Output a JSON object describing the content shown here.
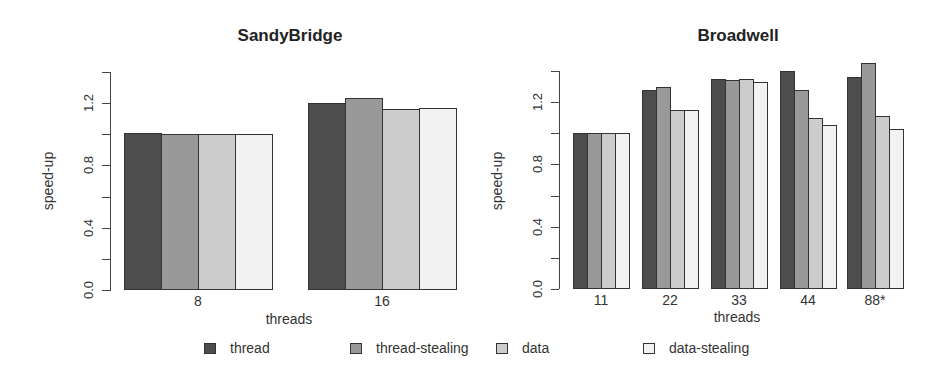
{
  "chart_data": [
    {
      "type": "bar",
      "title": "SandyBridge",
      "xlabel": "threads",
      "ylabel": "speed-up",
      "ylim": [
        0,
        1.4
      ],
      "yticks": [
        "0.0",
        "0.4",
        "0.8",
        "1.2"
      ],
      "categories": [
        "8",
        "16"
      ],
      "series": [
        {
          "name": "thread",
          "values": [
            1.01,
            1.2
          ]
        },
        {
          "name": "thread-stealing",
          "values": [
            1.0,
            1.23
          ]
        },
        {
          "name": "data",
          "values": [
            1.0,
            1.16
          ]
        },
        {
          "name": "data-stealing",
          "values": [
            1.0,
            1.17
          ]
        }
      ],
      "grid": false
    },
    {
      "type": "bar",
      "title": "Broadwell",
      "xlabel": "threads",
      "ylabel": "speed-up",
      "ylim": [
        0,
        1.4
      ],
      "yticks": [
        "0.0",
        "0.4",
        "0.8",
        "1.2"
      ],
      "categories": [
        "11",
        "22",
        "33",
        "44",
        "88*"
      ],
      "series": [
        {
          "name": "thread",
          "values": [
            1.0,
            1.28,
            1.35,
            1.4,
            1.36
          ]
        },
        {
          "name": "thread-stealing",
          "values": [
            1.0,
            1.3,
            1.34,
            1.28,
            1.45
          ]
        },
        {
          "name": "data",
          "values": [
            1.0,
            1.15,
            1.35,
            1.1,
            1.11
          ]
        },
        {
          "name": "data-stealing",
          "values": [
            1.0,
            1.15,
            1.33,
            1.05,
            1.03
          ]
        }
      ],
      "grid": false
    }
  ],
  "legend": {
    "position": "bottom",
    "items": [
      {
        "label": "thread",
        "color": "#4d4d4d"
      },
      {
        "label": "thread-stealing",
        "color": "#999999"
      },
      {
        "label": "data",
        "color": "#cccccc"
      },
      {
        "label": "data-stealing",
        "color": "#f2f2f2"
      }
    ]
  },
  "colors": [
    "#4d4d4d",
    "#999999",
    "#cccccc",
    "#f2f2f2"
  ]
}
